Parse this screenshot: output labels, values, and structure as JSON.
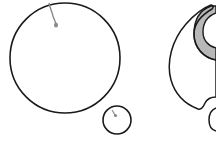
{
  "figure": {
    "width": 216,
    "height": 141,
    "background": "#ffffff",
    "stroke_color": "#1a1a1a",
    "fill_gray": "#b8b8b8",
    "dot_gray": "#8a8a8a"
  },
  "panels": [
    {
      "id": "left",
      "elements": [
        {
          "type": "circle",
          "name": "large-cell",
          "cx": 65,
          "cy": 58,
          "r": 55
        },
        {
          "type": "circle",
          "name": "small-cell",
          "cx": 117,
          "cy": 119,
          "r": 14
        },
        {
          "type": "tail",
          "name": "large-cell-attachment",
          "from": [
            49,
            3
          ],
          "to": [
            56,
            24
          ]
        },
        {
          "type": "dot",
          "name": "large-cell-dot",
          "cx": 56,
          "cy": 25
        },
        {
          "type": "dot",
          "name": "small-cell-dot",
          "cx": 115,
          "cy": 115
        }
      ]
    },
    {
      "id": "right",
      "elements": [
        {
          "type": "crescent-cell",
          "name": "engulfing-cell"
        },
        {
          "type": "shaded-band",
          "name": "crescent-membrane"
        },
        {
          "type": "partial-circle",
          "name": "bud-cell"
        }
      ]
    }
  ]
}
